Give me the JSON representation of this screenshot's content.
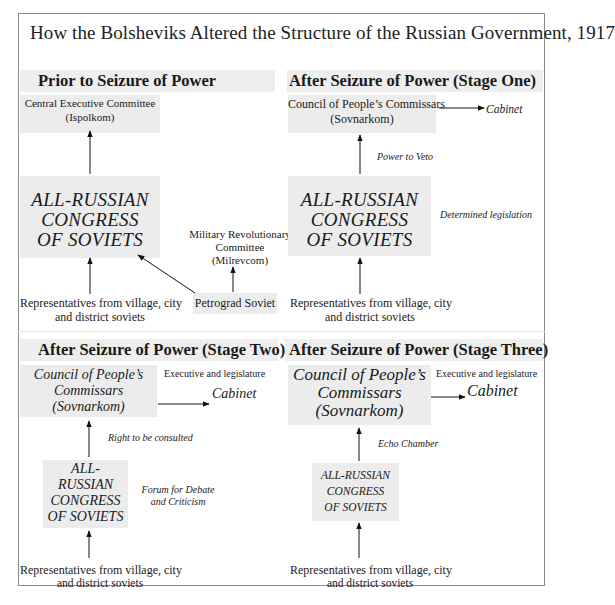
{
  "title": "How the Bolsheviks Altered the Structure of the Russian Government, 1917",
  "panels": {
    "prior": {
      "heading": "Prior to Seizure of Power",
      "cec": {
        "line1": "Central Executive Committee",
        "line2": "(Ispolkom)"
      },
      "congress": {
        "line1": "ALL-RUSSIAN",
        "line2": "CONGRESS",
        "line3": "OF SOVIETS"
      },
      "milrevcom": {
        "line1": "Military Revolutionary",
        "line2": "Committee",
        "line3": "(Milrevcom)"
      },
      "petrograd": "Petrograd Soviet",
      "reps": {
        "line1": "Representatives from village, city",
        "line2": "and district soviets"
      }
    },
    "stage1": {
      "heading": "After Seizure of Power (Stage One)",
      "sovnarkom": {
        "line1": "Council of People’s Commissars",
        "line2": "(Sovnarkom)"
      },
      "cabinet": "Cabinet",
      "veto_note": "Power to Veto",
      "congress": {
        "line1": "ALL-RUSSIAN",
        "line2": "CONGRESS",
        "line3": "OF SOVIETS"
      },
      "legislation_note": "Determined legislation",
      "reps": {
        "line1": "Representatives from village, city",
        "line2": "and district soviets"
      }
    },
    "stage2": {
      "heading": "After Seizure of Power (Stage Two)",
      "exec_note": "Executive and legislature",
      "sovnarkom": {
        "line1": "Council of People’s",
        "line2": "Commissars",
        "line3": "(Sovnarkom)"
      },
      "cabinet": "Cabinet",
      "consult_note": "Right to be consulted",
      "congress": {
        "line1": "ALL-",
        "line2": "RUSSIAN",
        "line3": "CONGRESS",
        "line4": "OF SOVIETS"
      },
      "forum_note": {
        "line1": "Forum for Debate",
        "line2": "and Criticism"
      },
      "reps": {
        "line1": "Representatives from village, city",
        "line2": "and district soviets"
      }
    },
    "stage3": {
      "heading": "After Seizure of Power (Stage Three)",
      "exec_note": "Executive and legislature",
      "sovnarkom": {
        "line1": "Council of People’s",
        "line2": "Commissars",
        "line3": "(Sovnarkom)"
      },
      "cabinet": "Cabinet",
      "echo_note": "Echo Chamber",
      "congress": {
        "line1": "ALL-RUSSIAN",
        "line2": "CONGRESS",
        "line3": "OF SOVIETS"
      },
      "reps": {
        "line1": "Representatives from village, city",
        "line2": "and district soviets"
      }
    }
  },
  "colors": {
    "box_fill": "#ececec",
    "band_fill": "#eeeeee",
    "frame": "#8a8a8a",
    "text": "#1a1a1a"
  }
}
